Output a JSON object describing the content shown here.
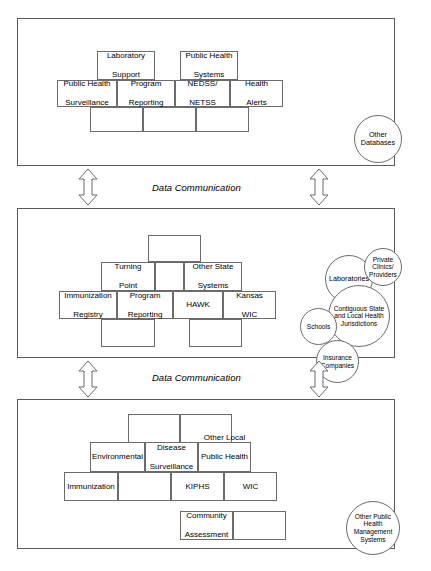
{
  "diagram": {
    "tiers": [
      {
        "id": "federal",
        "label": "Federal",
        "top_boxes": [
          {
            "name": "laboratory-support",
            "lines": [
              "Laboratory",
              "Support"
            ]
          },
          {
            "name": "public-health-systems",
            "lines": [
              "Public Health",
              "Systems"
            ]
          }
        ],
        "mid_boxes": [
          {
            "name": "public-health-surveillance",
            "lines": [
              "Public Health",
              "Surveillance"
            ]
          },
          {
            "name": "program-reporting",
            "lines": [
              "Program",
              "Reporting"
            ]
          },
          {
            "name": "nedss-netss",
            "lines": [
              "NEDSS/",
              "NETSS"
            ]
          },
          {
            "name": "health-alerts",
            "lines": [
              "Health",
              "Alerts"
            ]
          }
        ],
        "bottom_boxes": [
          {
            "name": "federal-bottom-box-1",
            "lines": []
          },
          {
            "name": "federal-bottom-box-2",
            "lines": []
          },
          {
            "name": "federal-bottom-box-3",
            "lines": []
          }
        ],
        "circles": [
          {
            "name": "other-databases",
            "lines": [
              "Other",
              "Databases"
            ]
          }
        ]
      },
      {
        "id": "state",
        "label": "State",
        "top_boxes": [
          {
            "name": "state-top-box",
            "lines": []
          }
        ],
        "upper_boxes": [
          {
            "name": "turning-point",
            "lines": [
              "Turning",
              "Point"
            ]
          },
          {
            "name": "state-upper-empty",
            "lines": []
          },
          {
            "name": "other-state-systems",
            "lines": [
              "Other State",
              "Systems"
            ]
          }
        ],
        "mid_boxes": [
          {
            "name": "immunization-registry",
            "lines": [
              "Immunization",
              "Registry"
            ]
          },
          {
            "name": "program-reporting",
            "lines": [
              "Program",
              "Reporting"
            ]
          },
          {
            "name": "hawk",
            "lines": [
              "HAWK"
            ]
          },
          {
            "name": "kansas-wic",
            "lines": [
              "Kansas",
              "WIC"
            ]
          }
        ],
        "bottom_boxes": [
          {
            "name": "state-bottom-box-1",
            "lines": []
          },
          {
            "name": "state-bottom-box-2",
            "lines": []
          }
        ],
        "circles": [
          {
            "name": "laboratories",
            "lines": [
              "Laboratories"
            ]
          },
          {
            "name": "private-clinics-providers",
            "lines": [
              "Private",
              "Clinics/",
              "Providers"
            ]
          },
          {
            "name": "contiguous-state-and-local-health-jurisdictions",
            "lines": [
              "Contiguous State",
              "and Local Health",
              "Jurisdictions"
            ]
          },
          {
            "name": "schools",
            "lines": [
              "Schools"
            ]
          },
          {
            "name": "insurance-companies",
            "lines": [
              "Insurance",
              "Companies"
            ]
          }
        ]
      },
      {
        "id": "local",
        "label": "Local",
        "top_boxes": [
          {
            "name": "local-top-box-1",
            "lines": []
          },
          {
            "name": "local-top-box-2",
            "lines": []
          }
        ],
        "upper_boxes": [
          {
            "name": "environmental",
            "lines": [
              "Environmental"
            ]
          },
          {
            "name": "disease-surveillance",
            "lines": [
              "Disease",
              "Surveillance"
            ]
          },
          {
            "name": "other-local-public-health-services",
            "lines": [
              "Other Local",
              "Public Health",
              "Services"
            ]
          }
        ],
        "mid_boxes": [
          {
            "name": "immunization",
            "lines": [
              "Immunization"
            ]
          },
          {
            "name": "local-mid-empty",
            "lines": []
          },
          {
            "name": "kiphs",
            "lines": [
              "KIPHS"
            ]
          },
          {
            "name": "wic",
            "lines": [
              "WIC"
            ]
          }
        ],
        "bottom_boxes": [
          {
            "name": "community-assessment",
            "lines": [
              "Community",
              "Assessment"
            ]
          },
          {
            "name": "local-bottom-empty",
            "lines": []
          }
        ],
        "circles": [
          {
            "name": "other-public-health-management-systems",
            "lines": [
              "Other Public",
              "Health",
              "Management",
              "Systems"
            ]
          }
        ]
      }
    ],
    "connectors": [
      {
        "name": "data-communication-federal-state",
        "label": "Data Communication"
      },
      {
        "name": "data-communication-state-local",
        "label": "Data Communication"
      }
    ],
    "colors": {
      "stroke": "#6b6b6b",
      "tier_stroke": "#5a5a5a",
      "background": "#ffffff",
      "text": "#000000"
    }
  }
}
